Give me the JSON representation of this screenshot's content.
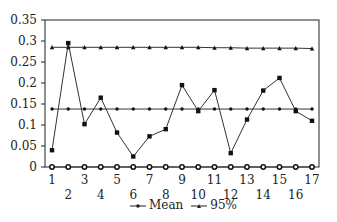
{
  "chart_data": {
    "type": "line",
    "title": "",
    "xlabel": "",
    "ylabel": "",
    "x": [
      1,
      2,
      3,
      4,
      5,
      6,
      7,
      8,
      9,
      10,
      11,
      12,
      13,
      14,
      15,
      16,
      17
    ],
    "y_ticks": [
      "0",
      "0.05",
      "0.1",
      "0.15",
      "0.2",
      "0.25",
      "0.3",
      "0.35"
    ],
    "ylim": [
      0,
      0.35
    ],
    "grid": false,
    "legend_position": "bottom",
    "series": [
      {
        "name": "Data",
        "marker": "square",
        "values": [
          0.04,
          0.295,
          0.102,
          0.165,
          0.082,
          0.025,
          0.073,
          0.09,
          0.195,
          0.133,
          0.183,
          0.033,
          0.113,
          0.182,
          0.212,
          0.133,
          0.11
        ]
      },
      {
        "name": "Mean",
        "marker": "dot",
        "values": [
          0.138,
          0.138,
          0.138,
          0.138,
          0.138,
          0.138,
          0.138,
          0.138,
          0.138,
          0.138,
          0.138,
          0.138,
          0.138,
          0.138,
          0.138,
          0.138,
          0.138
        ]
      },
      {
        "name": "95%",
        "marker": "triangle",
        "values": [
          0.285,
          0.285,
          0.285,
          0.285,
          0.285,
          0.285,
          0.285,
          0.285,
          0.285,
          0.285,
          0.284,
          0.284,
          0.283,
          0.283,
          0.283,
          0.283,
          0.282
        ]
      },
      {
        "name": "Zero",
        "marker": "circle",
        "values": [
          0,
          0,
          0,
          0,
          0,
          0,
          0,
          0,
          0,
          0,
          0,
          0,
          0,
          0,
          0,
          0,
          0
        ]
      }
    ]
  },
  "legend": {
    "mean": "Mean",
    "p95": "95%"
  }
}
